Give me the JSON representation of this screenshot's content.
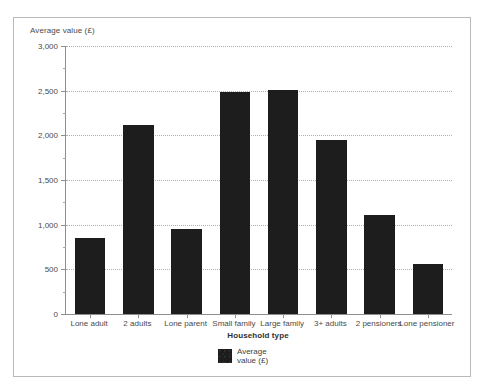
{
  "figure": {
    "y_axis_title": "Average value (£)",
    "x_axis_title": "Household type",
    "top_sliver_text": ""
  },
  "legend": {
    "swatch_name": "average-value-swatch",
    "label": "Average\nvalue (£)"
  },
  "chart_data": {
    "type": "bar",
    "title": "",
    "xlabel": "Household type",
    "ylabel": "Average value (£)",
    "ylim": [
      0,
      3000
    ],
    "ytick_step": 500,
    "yminor_step": 250,
    "grid": true,
    "legend_position": "bottom-center",
    "series_color": "#1d1d1d",
    "categories": [
      "Lone adult",
      "2 adults",
      "Lone parent",
      "Small family",
      "Large family",
      "3+ adults",
      "2 pensioners",
      "Lone pensioner"
    ],
    "series": [
      {
        "name": "Average value (£)",
        "values": [
          850,
          2120,
          950,
          2480,
          2510,
          1950,
          1110,
          560
        ]
      }
    ],
    "ytick_labels": [
      "0",
      "500",
      "1,000",
      "1,500",
      "2,000",
      "2,500",
      "3,000"
    ],
    "ytick_values": [
      0,
      500,
      1000,
      1500,
      2000,
      2500,
      3000
    ]
  }
}
